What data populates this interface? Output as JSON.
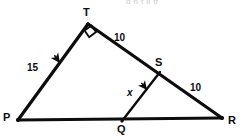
{
  "figure": {
    "title_fragment": "g         n  t   ll  tr",
    "background_color": "#ffffff",
    "stroke_color": "#0d0d0d",
    "vertices": [
      {
        "name": "T",
        "label": "T",
        "x": 88,
        "y": 24,
        "label_x": 83,
        "label_y": 7
      },
      {
        "name": "P",
        "label": "P",
        "x": 18,
        "y": 120,
        "label_x": 3,
        "label_y": 112
      },
      {
        "name": "R",
        "label": "R",
        "x": 222,
        "y": 118,
        "label_x": 228,
        "label_y": 115
      },
      {
        "name": "S",
        "label": "S",
        "x": 160,
        "y": 72,
        "label_x": 155,
        "label_y": 57
      },
      {
        "name": "Q",
        "label": "Q",
        "x": 122,
        "y": 121,
        "label_x": 117,
        "label_y": 124
      }
    ],
    "segments": [
      {
        "name": "segment-PT",
        "from": "P",
        "to": "T"
      },
      {
        "name": "segment-TR",
        "from": "T",
        "to": "R"
      },
      {
        "name": "segment-PR",
        "from": "P",
        "to": "R"
      },
      {
        "name": "segment-SQ",
        "from": "S",
        "to": "Q"
      }
    ],
    "right_angle": {
      "at": "T",
      "marker": "square"
    },
    "measures": [
      {
        "name": "length-PT",
        "value": "15",
        "x": 27,
        "y": 63,
        "segment": "PT"
      },
      {
        "name": "length-TS",
        "value": "10",
        "x": 114,
        "y": 33,
        "segment": "TS"
      },
      {
        "name": "length-SR",
        "value": "10",
        "x": 190,
        "y": 83,
        "segment": "SR"
      },
      {
        "name": "length-SQ",
        "value": "x",
        "x": 127,
        "y": 88,
        "segment": "SQ"
      }
    ],
    "arrow_marks": [
      {
        "name": "arrow-on-PT",
        "x": 60,
        "y": 63,
        "angle": 234
      },
      {
        "name": "arrow-on-SQ",
        "x": 147,
        "y": 90,
        "angle": 232
      }
    ]
  }
}
